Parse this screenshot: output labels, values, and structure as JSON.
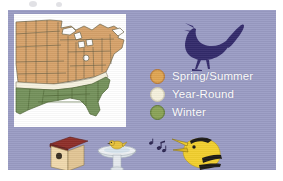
{
  "figure": {
    "panel_color": "#9a9cc4",
    "map_background": "#ffffff"
  },
  "map": {
    "name": "united-states-range-map",
    "regions": [
      {
        "key": "spring_summer",
        "label": "Spring/Summer",
        "color": "#d6a26a",
        "area": "northern and central United States"
      },
      {
        "key": "year_round",
        "label": "Year-Round",
        "color": "#f2edd8",
        "area": "narrow mid-latitude band"
      },
      {
        "key": "winter",
        "label": "Winter",
        "color": "#74915b",
        "area": "southeastern United States and Gulf coast"
      }
    ],
    "outline_color": "#6b6348"
  },
  "legend": {
    "name": "seasonal-range-legend",
    "text_color": "#ffffff",
    "items": [
      {
        "label": "Spring/Summer",
        "color": "#e0a552",
        "ring": "#b9762f"
      },
      {
        "label": "Year-Round",
        "color": "#f5f0dc",
        "ring": "#c9c2a3"
      },
      {
        "label": "Winter",
        "color": "#8aa356",
        "ring": "#5e7a36"
      }
    ]
  },
  "illustrations": {
    "wren": {
      "label": "singing wren silhouette",
      "color": "#332a6b"
    },
    "birdhouse": {
      "label": "birdhouse",
      "roof_color": "#8e2e28",
      "body_color": "#f0d9ad"
    },
    "birdbath": {
      "label": "birdbath with bird",
      "basin_color": "#e8ecef",
      "bird_color": "#e8c33c"
    },
    "music_notes": {
      "label": "music notes",
      "color": "#2b2550"
    },
    "goldfinch": {
      "label": "singing goldfinch head",
      "body_color": "#f2cf2e",
      "marking_color": "#1c1a16"
    }
  }
}
